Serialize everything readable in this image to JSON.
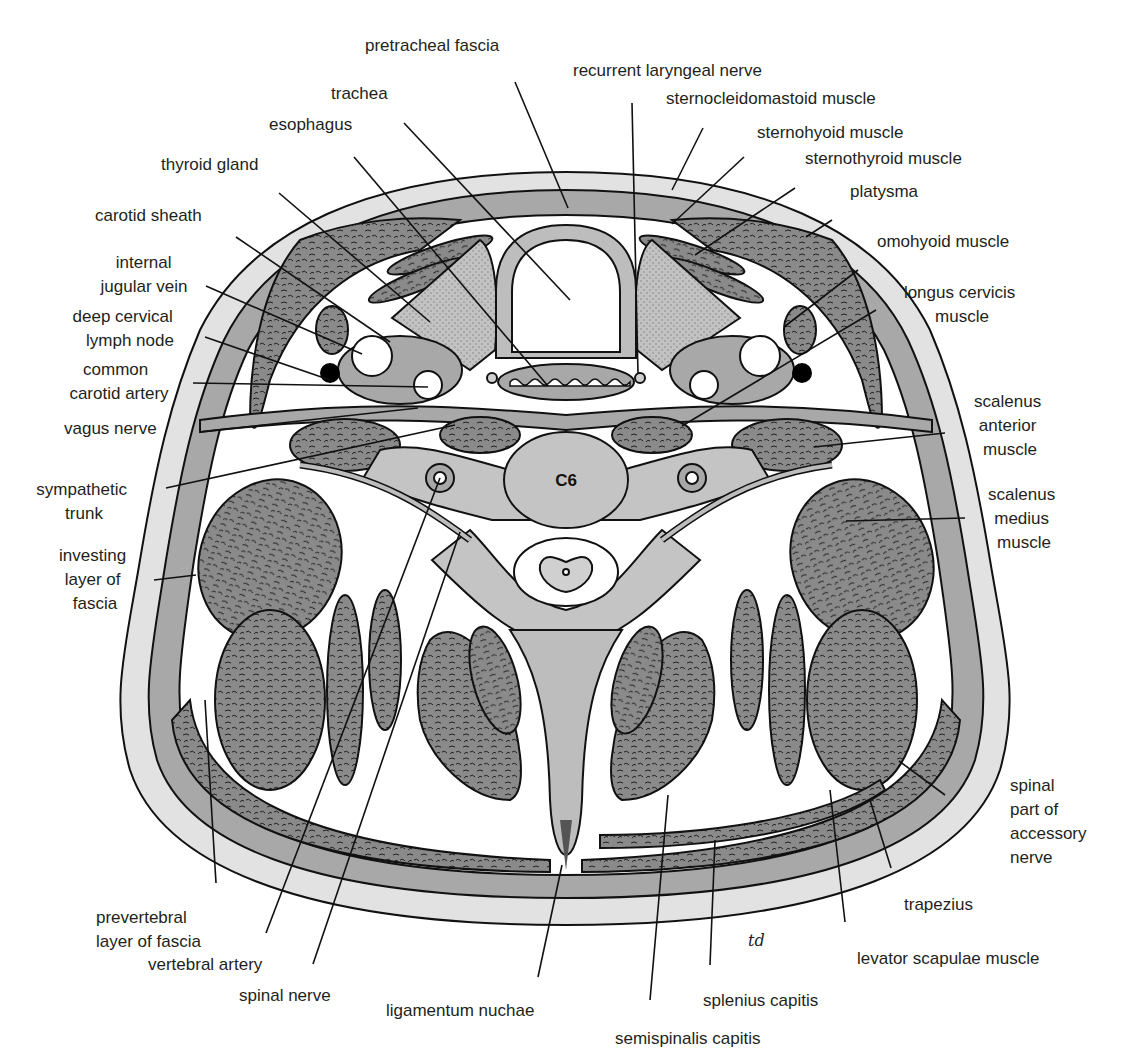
{
  "figure": {
    "vertebra_label": "C6",
    "artist_signature": "td"
  },
  "labels": {
    "pretracheal_fascia": "pretracheal fascia",
    "recurrent_laryngeal_nerve": "recurrent laryngeal nerve",
    "trachea": "trachea",
    "sternocleidomastoid_muscle": "sternocleidomastoid muscle",
    "esophagus": "esophagus",
    "sternohyoid_muscle": "sternohyoid muscle",
    "sternothyroid_muscle": "sternothyroid muscle",
    "thyroid_gland": "thyroid gland",
    "platysma": "platysma",
    "carotid_sheath": "carotid sheath",
    "omohyoid_muscle": "omohyoid muscle",
    "internal_jugular_vein": [
      "internal",
      "jugular vein"
    ],
    "longus_cervicis_muscle": [
      "longus cervicis",
      "muscle"
    ],
    "deep_cervical_lymph_node": [
      "deep cervical",
      "lymph node"
    ],
    "common_carotid_artery": [
      "common",
      "carotid artery"
    ],
    "vagus_nerve": "vagus nerve",
    "scalenus_anterior_muscle": [
      "scalenus",
      "anterior",
      "muscle"
    ],
    "sympathetic_trunk": [
      "sympathetic",
      "trunk"
    ],
    "scalenus_medius_muscle": [
      "scalenus",
      "medius",
      "muscle"
    ],
    "investing_layer_of_fascia": [
      "investing",
      "layer of",
      "fascia"
    ],
    "spinal_part_of_accessory_nerve": [
      "spinal",
      "part of",
      "accessory",
      "nerve"
    ],
    "trapezius": "trapezius",
    "prevertebral_layer_of_fascia": [
      "prevertebral",
      "layer of fascia"
    ],
    "vertebral_artery": "vertebral artery",
    "levator_scapulae_muscle": "levator scapulae muscle",
    "spinal_nerve": "spinal nerve",
    "splenius_capitis": "splenius capitis",
    "ligamentum_nuchae": "ligamentum nuchae",
    "semispinalis_capitis": "semispinalis capitis"
  },
  "colors": {
    "skin": "#e2e2e2",
    "fascia": "#a8a8a8",
    "muscle": "#8c8c8c",
    "outline": "#111111",
    "background": "#ffffff"
  }
}
